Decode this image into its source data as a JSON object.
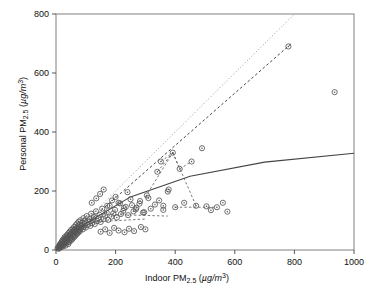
{
  "chart_data": {
    "type": "scatter",
    "title": "",
    "xlabel": "Indoor PM2.5 (µg/m3)",
    "ylabel": "Personal PM2.5 (µg/m3)",
    "xlabel_parts": {
      "prefix": "Indoor PM",
      "sub": "2.5",
      "unit_open": " (",
      "unit_mu": "µg/m",
      "unit_sup": "3",
      "unit_close": ")"
    },
    "ylabel_parts": {
      "prefix": "Personal PM",
      "sub": "2.5",
      "unit_open": " (",
      "unit_mu": "µg/m",
      "unit_sup": "3",
      "unit_close": ")"
    },
    "xlim": [
      0,
      1000
    ],
    "ylim": [
      0,
      800
    ],
    "xticks": [
      0,
      200,
      400,
      600,
      800,
      1000
    ],
    "yticks": [
      0,
      200,
      400,
      600,
      800
    ],
    "xticklabels": [
      "0",
      "200",
      "400",
      "600",
      "800",
      "1000"
    ],
    "yticklabels": [
      "0",
      "200",
      "400",
      "600",
      "800"
    ],
    "grid": false,
    "legend": "none",
    "marker": {
      "shape": "circle-open-dot",
      "radius": 2.6,
      "color": "#555555",
      "fill": "none"
    },
    "points": [
      [
        5,
        6
      ],
      [
        8,
        10
      ],
      [
        9,
        4
      ],
      [
        11,
        14
      ],
      [
        12,
        8
      ],
      [
        13,
        18
      ],
      [
        14,
        11
      ],
      [
        15,
        22
      ],
      [
        16,
        9
      ],
      [
        17,
        16
      ],
      [
        18,
        25
      ],
      [
        19,
        13
      ],
      [
        20,
        28
      ],
      [
        21,
        19
      ],
      [
        22,
        34
      ],
      [
        23,
        12
      ],
      [
        24,
        23
      ],
      [
        25,
        30
      ],
      [
        26,
        17
      ],
      [
        27,
        38
      ],
      [
        28,
        21
      ],
      [
        29,
        44
      ],
      [
        30,
        26
      ],
      [
        31,
        33
      ],
      [
        32,
        15
      ],
      [
        33,
        41
      ],
      [
        34,
        29
      ],
      [
        35,
        48
      ],
      [
        36,
        24
      ],
      [
        37,
        36
      ],
      [
        38,
        52
      ],
      [
        39,
        31
      ],
      [
        40,
        43
      ],
      [
        41,
        20
      ],
      [
        42,
        57
      ],
      [
        43,
        38
      ],
      [
        44,
        27
      ],
      [
        45,
        49
      ],
      [
        46,
        62
      ],
      [
        47,
        35
      ],
      [
        48,
        45
      ],
      [
        49,
        55
      ],
      [
        50,
        32
      ],
      [
        51,
        68
      ],
      [
        52,
        41
      ],
      [
        53,
        50
      ],
      [
        54,
        60
      ],
      [
        55,
        37
      ],
      [
        56,
        72
      ],
      [
        57,
        46
      ],
      [
        58,
        56
      ],
      [
        59,
        66
      ],
      [
        60,
        43
      ],
      [
        61,
        78
      ],
      [
        62,
        52
      ],
      [
        63,
        61
      ],
      [
        64,
        70
      ],
      [
        65,
        48
      ],
      [
        66,
        84
      ],
      [
        67,
        57
      ],
      [
        68,
        66
      ],
      [
        69,
        75
      ],
      [
        70,
        54
      ],
      [
        71,
        90
      ],
      [
        72,
        62
      ],
      [
        73,
        71
      ],
      [
        74,
        80
      ],
      [
        75,
        59
      ],
      [
        76,
        96
      ],
      [
        77,
        67
      ],
      [
        78,
        76
      ],
      [
        79,
        86
      ],
      [
        80,
        64
      ],
      [
        82,
        101
      ],
      [
        84,
        73
      ],
      [
        86,
        82
      ],
      [
        88,
        92
      ],
      [
        90,
        70
      ],
      [
        92,
        108
      ],
      [
        94,
        79
      ],
      [
        96,
        88
      ],
      [
        98,
        98
      ],
      [
        100,
        76
      ],
      [
        103,
        115
      ],
      [
        106,
        85
      ],
      [
        109,
        95
      ],
      [
        112,
        105
      ],
      [
        115,
        82
      ],
      [
        118,
        123
      ],
      [
        121,
        91
      ],
      [
        124,
        101
      ],
      [
        127,
        112
      ],
      [
        130,
        88
      ],
      [
        134,
        131
      ],
      [
        138,
        98
      ],
      [
        142,
        108
      ],
      [
        146,
        119
      ],
      [
        150,
        95
      ],
      [
        155,
        140
      ],
      [
        160,
        105
      ],
      [
        165,
        116
      ],
      [
        170,
        127
      ],
      [
        175,
        102
      ],
      [
        180,
        150
      ],
      [
        186,
        113
      ],
      [
        192,
        124
      ],
      [
        198,
        136
      ],
      [
        204,
        110
      ],
      [
        210,
        160
      ],
      [
        218,
        122
      ],
      [
        226,
        133
      ],
      [
        234,
        146
      ],
      [
        242,
        118
      ],
      [
        250,
        172
      ],
      [
        260,
        131
      ],
      [
        270,
        143
      ],
      [
        280,
        157
      ],
      [
        292,
        127
      ],
      [
        305,
        185
      ],
      [
        318,
        140
      ],
      [
        332,
        154
      ],
      [
        346,
        168
      ],
      [
        360,
        136
      ],
      [
        375,
        198
      ],
      [
        150,
        62
      ],
      [
        165,
        70
      ],
      [
        180,
        58
      ],
      [
        195,
        75
      ],
      [
        210,
        66
      ],
      [
        230,
        60
      ],
      [
        245,
        72
      ],
      [
        262,
        64
      ],
      [
        285,
        78
      ],
      [
        300,
        70
      ],
      [
        340,
        265
      ],
      [
        352,
        300
      ],
      [
        360,
        150
      ],
      [
        378,
        205
      ],
      [
        392,
        330
      ],
      [
        400,
        145
      ],
      [
        415,
        275
      ],
      [
        430,
        160
      ],
      [
        455,
        300
      ],
      [
        470,
        150
      ],
      [
        490,
        345
      ],
      [
        505,
        148
      ],
      [
        520,
        135
      ],
      [
        540,
        145
      ],
      [
        560,
        160
      ],
      [
        575,
        130
      ],
      [
        780,
        690
      ],
      [
        935,
        535
      ],
      [
        120,
        160
      ],
      [
        135,
        175
      ],
      [
        148,
        190
      ],
      [
        160,
        205
      ],
      [
        172,
        150
      ],
      [
        188,
        168
      ],
      [
        200,
        180
      ],
      [
        215,
        158
      ],
      [
        228,
        142
      ],
      [
        240,
        196
      ],
      [
        255,
        152
      ],
      [
        268,
        138
      ],
      [
        282,
        166
      ],
      [
        296,
        128
      ],
      [
        310,
        176
      ]
    ],
    "reference_lines": [
      {
        "name": "identity-line",
        "style": "dotted",
        "color": "#999999",
        "points": [
          [
            0,
            0
          ],
          [
            800,
            800
          ]
        ],
        "note": "1:1 line"
      },
      {
        "name": "regression-line-dashed",
        "style": "dashed",
        "color": "#444444",
        "points": [
          [
            0,
            0
          ],
          [
            790,
            700
          ]
        ]
      },
      {
        "name": "fit-curve-solid",
        "style": "solid",
        "color": "#444444",
        "points": [
          [
            0,
            0
          ],
          [
            100,
            90
          ],
          [
            250,
            180
          ],
          [
            450,
            250
          ],
          [
            700,
            298
          ],
          [
            1000,
            328
          ]
        ]
      }
    ],
    "connector_segments": [
      {
        "style": "dashed",
        "points": [
          [
            340,
            265
          ],
          [
            392,
            330
          ]
        ]
      },
      {
        "style": "dashed",
        "points": [
          [
            392,
            330
          ],
          [
            415,
            275
          ]
        ]
      },
      {
        "style": "dashed",
        "points": [
          [
            415,
            275
          ],
          [
            455,
            300
          ]
        ]
      },
      {
        "style": "dashed",
        "points": [
          [
            352,
            300
          ],
          [
            392,
            330
          ]
        ]
      },
      {
        "style": "dashed",
        "points": [
          [
            300,
            180
          ],
          [
            392,
            330
          ]
        ]
      },
      {
        "style": "dashed",
        "points": [
          [
            392,
            330
          ],
          [
            470,
            150
          ]
        ]
      },
      {
        "style": "dashed",
        "points": [
          [
            400,
            145
          ],
          [
            540,
            145
          ]
        ]
      },
      {
        "style": "dashed",
        "points": [
          [
            200,
            120
          ],
          [
            375,
            115
          ]
        ]
      },
      {
        "style": "dashed",
        "points": [
          [
            120,
            95
          ],
          [
            300,
            105
          ]
        ]
      }
    ]
  },
  "axes": {
    "frame_color": "#808080",
    "tick_color": "#555555"
  }
}
